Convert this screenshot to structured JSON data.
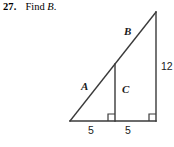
{
  "problem": {
    "number": "27.",
    "instruction": "Find",
    "unknown": "B",
    "period": "."
  },
  "figure": {
    "name": "right-triangle-with-altitude-diagram",
    "stroke_color": "#3a3a3a",
    "background_color": "#ffffff",
    "labels": {
      "hypotenuse_lower": "A",
      "hypotenuse_upper": "B",
      "interior_segment": "C",
      "vertical_leg": "12",
      "base_left_segment": "5",
      "base_right_segment": "5"
    },
    "right_angle_marks": [
      "interior-segment-base-right-angle",
      "bottom-right-vertex-right-angle"
    ],
    "geometry": {
      "apex": [
        156,
        12
      ],
      "bottom_left": [
        70,
        121
      ],
      "bottom_right": [
        156,
        121
      ],
      "interior_foot": [
        115,
        121
      ],
      "interior_top": [
        115,
        62
      ]
    }
  }
}
